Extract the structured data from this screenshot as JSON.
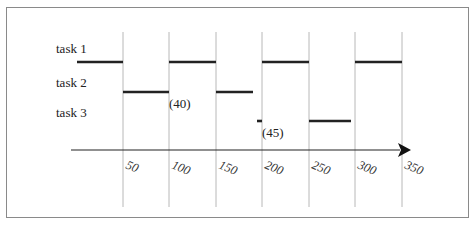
{
  "diagram": {
    "type": "gantt-timeline",
    "tasks": [
      {
        "label": "task 1",
        "y": 62,
        "segments": [
          [
            77,
            123
          ],
          [
            169,
            216
          ],
          [
            262,
            309
          ],
          [
            355,
            402
          ]
        ]
      },
      {
        "label": "task 2",
        "y": 92,
        "segments": [
          [
            123,
            169
          ],
          [
            216,
            253
          ]
        ]
      },
      {
        "label": "task 3",
        "y": 121,
        "segments": [
          [
            257,
            262
          ],
          [
            309,
            351
          ]
        ]
      }
    ],
    "annotations": [
      {
        "text": "(40)",
        "x": 169,
        "y": 108
      },
      {
        "text": "(45)",
        "x": 262,
        "y": 137
      }
    ],
    "axis": {
      "ticks": [
        "50",
        "100",
        "150",
        "200",
        "250",
        "300",
        "350"
      ],
      "tick_positions": [
        123,
        169,
        216,
        262,
        309,
        355,
        402
      ]
    }
  },
  "colors": {
    "segment": "#222222",
    "gridline": "#b8b8b8",
    "axis": "#222222",
    "border": "#8a8a8a"
  }
}
